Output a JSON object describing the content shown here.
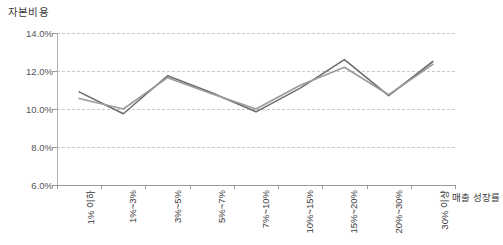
{
  "chart_data": {
    "type": "line",
    "title": "",
    "ylabel": "자본비용",
    "xlabel": "매출 성장률",
    "categories": [
      "1% 이하",
      "1%~3%",
      "3%~5%",
      "5%~7%",
      "7%~10%",
      "10%~15%",
      "15%~20%",
      "20%~30%",
      "30% 이상"
    ],
    "ytick_labels": [
      "14.0%",
      "12.0%",
      "10.0%",
      "8.0%",
      "6.0%"
    ],
    "ytick_values": [
      14.0,
      12.0,
      10.0,
      8.0,
      6.0
    ],
    "ylim": [
      6.0,
      14.0
    ],
    "grid": true,
    "legend": "none",
    "series": [
      {
        "name": "series-1",
        "color": "#6d6d6d",
        "values": [
          10.9,
          9.75,
          11.75,
          10.85,
          9.85,
          11.1,
          12.6,
          10.7,
          12.5
        ]
      },
      {
        "name": "series-2",
        "color": "#9a9a9a",
        "values": [
          10.55,
          10.0,
          11.65,
          10.8,
          10.0,
          11.25,
          12.2,
          10.75,
          12.35
        ]
      }
    ]
  },
  "colors": {
    "gridline": "#c9c9c9",
    "axis": "#9a9a9a",
    "text": "#3a3a3a"
  }
}
